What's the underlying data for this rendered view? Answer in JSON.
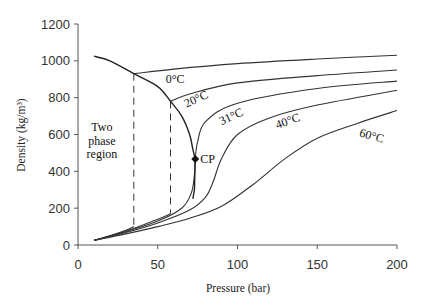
{
  "chart_data": {
    "type": "line",
    "title": "",
    "xlabel": "Pressure (bar)",
    "ylabel": "Density (kg/m³)",
    "xlim": [
      0,
      200
    ],
    "ylim": [
      0,
      1200
    ],
    "xticks": [
      0,
      50,
      100,
      150,
      200
    ],
    "yticks": [
      0,
      200,
      400,
      600,
      800,
      1000,
      1200
    ],
    "grid": false,
    "legend": "none (curves labeled inline)",
    "series": [
      {
        "name": "0°C",
        "x": [
          10,
          20,
          30,
          35,
          35,
          60,
          100,
          150,
          200
        ],
        "y": [
          25,
          50,
          80,
          100,
          930,
          955,
          985,
          1010,
          1030
        ]
      },
      {
        "name": "20°C",
        "x": [
          10,
          30,
          50,
          58,
          58,
          70,
          100,
          150,
          200
        ],
        "y": [
          25,
          75,
          140,
          170,
          780,
          820,
          880,
          920,
          950
        ]
      },
      {
        "name": "31°C",
        "x": [
          10,
          30,
          50,
          65,
          71,
          73,
          73.5,
          75,
          80,
          100,
          150,
          200
        ],
        "y": [
          25,
          72,
          130,
          200,
          280,
          380,
          467,
          560,
          670,
          770,
          850,
          890
        ]
      },
      {
        "name": "40°C",
        "x": [
          10,
          30,
          50,
          70,
          80,
          85,
          90,
          100,
          120,
          150,
          200
        ],
        "y": [
          25,
          68,
          120,
          190,
          260,
          350,
          470,
          600,
          690,
          760,
          840
        ]
      },
      {
        "name": "60°C",
        "x": [
          10,
          30,
          50,
          70,
          90,
          110,
          130,
          150,
          175,
          200
        ],
        "y": [
          25,
          60,
          100,
          145,
          210,
          330,
          470,
          580,
          660,
          730
        ]
      }
    ],
    "saturation_curve": {
      "x": [
        10,
        20,
        35,
        50,
        58,
        65,
        70,
        72,
        73.5
      ],
      "y": [
        1025,
        1000,
        930,
        860,
        780,
        700,
        600,
        520,
        467
      ]
    },
    "dashed_lines": [
      {
        "x": 35,
        "y_from": 100,
        "y_to": 930
      },
      {
        "x": 58,
        "y_from": 170,
        "y_to": 780
      }
    ],
    "critical_point": {
      "label": "CP",
      "x": 73.5,
      "y": 467
    },
    "annotations": [
      {
        "text": "Two",
        "x": 15,
        "y": 620
      },
      {
        "text": "phase",
        "x": 15,
        "y": 545
      },
      {
        "text": "region",
        "x": 15,
        "y": 470
      },
      {
        "text": "0°C",
        "x": 55,
        "y": 880,
        "rotate": 0
      },
      {
        "text": "20°C",
        "x": 68,
        "y": 745,
        "rotate": -25
      },
      {
        "text": "31°C",
        "x": 90,
        "y": 650,
        "rotate": -25
      },
      {
        "text": "40°C",
        "x": 125,
        "y": 630,
        "rotate": -20
      },
      {
        "text": "60°C",
        "x": 176,
        "y": 590,
        "rotate": 15
      }
    ]
  },
  "layout": {
    "plot_left": 78,
    "plot_right": 397,
    "plot_top": 24,
    "plot_bottom": 245
  }
}
